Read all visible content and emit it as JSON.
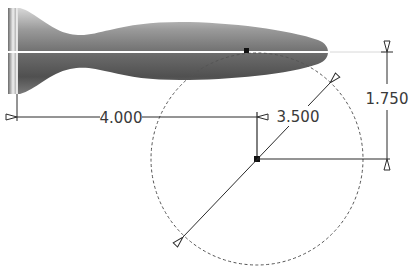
{
  "drawing": {
    "type": "cad-sketch",
    "part": "revolved profile (handle/fish shape)",
    "dimensions": {
      "horizontal": {
        "label": "4.000",
        "value": 4.0
      },
      "diameter": {
        "label": "3.500",
        "value": 3.5
      },
      "vertical": {
        "label": "1.750",
        "value": 1.75
      }
    },
    "colors": {
      "line": "#2a2a2a",
      "dashed_circle": "#555555",
      "centerline": "#ffffff",
      "body_dark": "#5a5a5a",
      "body_light": "#e8e8e8"
    }
  }
}
